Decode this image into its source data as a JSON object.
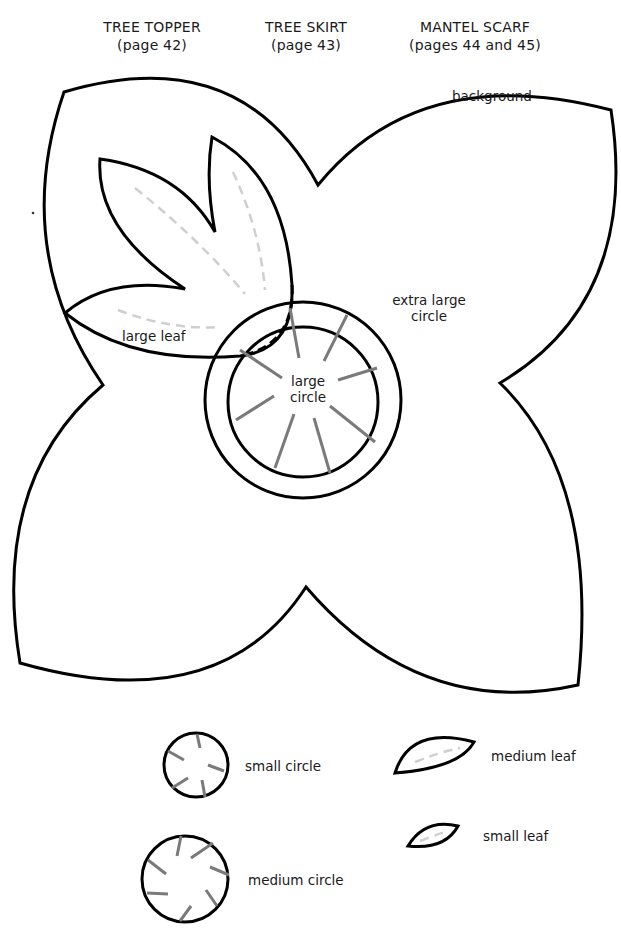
{
  "headers": [
    {
      "title": "TREE TOPPER",
      "subtitle": "(page 42)"
    },
    {
      "title": "TREE SKIRT",
      "subtitle": "(page 43)"
    },
    {
      "title": "MANTEL SCARF",
      "subtitle": "(pages 44 and 45)"
    }
  ],
  "labels": {
    "background": "background",
    "extra_large_circle_line1": "extra large",
    "extra_large_circle_line2": "circle",
    "large_circle_line1": "large",
    "large_circle_line2": "circle",
    "large_leaf": "large leaf",
    "small_circle": "small circle",
    "medium_circle": "medium circle",
    "medium_leaf": "medium leaf",
    "small_leaf": "small leaf"
  },
  "colors": {
    "outline": "#000000",
    "spoke": "#7a7a7a",
    "vein": "#cfcfcf",
    "paper": "#ffffff"
  },
  "pieces": [
    {
      "name": "background",
      "shape": "four-petal flower"
    },
    {
      "name": "large leaf",
      "shape": "three-lobed leaf"
    },
    {
      "name": "extra large circle",
      "shape": "circle"
    },
    {
      "name": "large circle",
      "shape": "circle with 10 spokes"
    },
    {
      "name": "small circle",
      "shape": "circle with 5 spokes"
    },
    {
      "name": "medium circle",
      "shape": "circle with 8 spokes"
    },
    {
      "name": "medium leaf",
      "shape": "leaf"
    },
    {
      "name": "small leaf",
      "shape": "leaf"
    }
  ]
}
